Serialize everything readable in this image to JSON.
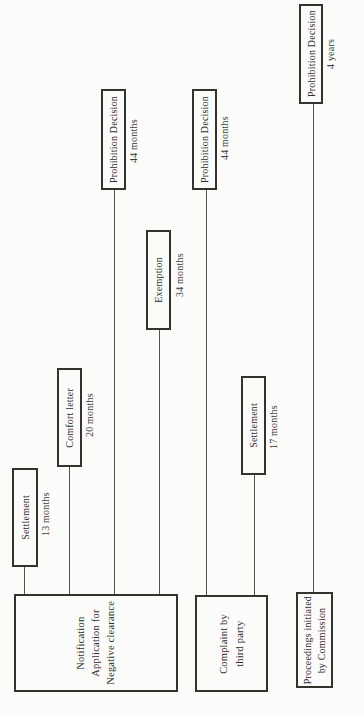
{
  "diagram": {
    "colors": {
      "background": "#fbfbf9",
      "box_border": "#333330",
      "connector_line": "#55534f",
      "text": "#2e2e2e"
    },
    "outcomes": [
      {
        "label": "Settlement",
        "duration": "13 months",
        "origin": "notification"
      },
      {
        "label": "Comfort letter",
        "duration": "20 months",
        "origin": "notification"
      },
      {
        "label": "Prohibition Decision",
        "duration": "44 months",
        "origin": "notification"
      },
      {
        "label": "Exemption",
        "duration": "34 months",
        "origin": "notification"
      },
      {
        "label": "Settlement",
        "duration": "17 months",
        "origin": "complaint"
      },
      {
        "label": "Prohibition Decision",
        "duration": "44 months",
        "origin": "complaint"
      },
      {
        "label": "Prohibition Decision",
        "duration": "4 years",
        "origin": "proceedings"
      }
    ],
    "origins": [
      {
        "id": "notification",
        "label": "Notification\nApplication for\nNegative clearance"
      },
      {
        "id": "complaint",
        "label": "Complaint by\nthird party"
      },
      {
        "id": "proceedings",
        "label": "Proceedings initiated\nby Commission"
      }
    ]
  }
}
